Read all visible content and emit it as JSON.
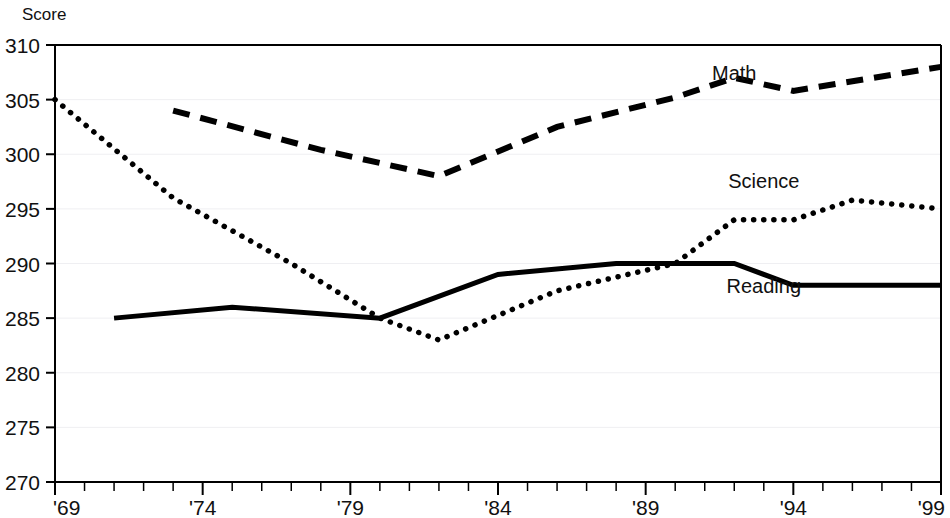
{
  "chart_data": {
    "type": "line",
    "title": "",
    "subtitle": "",
    "xlabel": "",
    "ylabel": "Score",
    "ylim": [
      270,
      310
    ],
    "xlim": [
      1969,
      1999
    ],
    "yticks": [
      270,
      275,
      280,
      285,
      290,
      295,
      300,
      305,
      310
    ],
    "ytick_labels": [
      "270",
      "275",
      "280",
      "285",
      "290",
      "295",
      "300",
      "305",
      "310"
    ],
    "xticks": [
      1969,
      1974,
      1979,
      1984,
      1989,
      1994,
      1999
    ],
    "xtick_labels": [
      "'69",
      "'74",
      "'79",
      "'84",
      "'89",
      "'94",
      "'99"
    ],
    "x_minor_tick_interval": 1,
    "grid": "horizontal-light",
    "legend_position": "inline-labels",
    "series": [
      {
        "name": "Math",
        "style": "dashed",
        "color": "#000000",
        "label_x": 1992,
        "label_y": 306.8,
        "points": [
          {
            "x": 1973,
            "y": 304
          },
          {
            "x": 1978,
            "y": 300.4
          },
          {
            "x": 1982,
            "y": 298
          },
          {
            "x": 1986,
            "y": 302.5
          },
          {
            "x": 1990,
            "y": 305.2
          },
          {
            "x": 1992,
            "y": 307
          },
          {
            "x": 1994,
            "y": 305.8
          },
          {
            "x": 1999,
            "y": 308
          }
        ]
      },
      {
        "name": "Science",
        "style": "dotted",
        "color": "#000000",
        "label_x": 1993,
        "label_y": 296.9,
        "points": [
          {
            "x": 1969,
            "y": 305
          },
          {
            "x": 1973,
            "y": 296
          },
          {
            "x": 1977,
            "y": 290
          },
          {
            "x": 1980,
            "y": 285
          },
          {
            "x": 1982,
            "y": 283
          },
          {
            "x": 1986,
            "y": 287.5
          },
          {
            "x": 1990,
            "y": 290
          },
          {
            "x": 1992,
            "y": 294
          },
          {
            "x": 1994,
            "y": 294
          },
          {
            "x": 1996,
            "y": 295.8
          },
          {
            "x": 1999,
            "y": 295
          }
        ]
      },
      {
        "name": "Reading",
        "style": "solid",
        "color": "#000000",
        "label_x": 1993,
        "label_y": 287.3,
        "points": [
          {
            "x": 1971,
            "y": 285
          },
          {
            "x": 1975,
            "y": 286
          },
          {
            "x": 1980,
            "y": 285
          },
          {
            "x": 1984,
            "y": 289
          },
          {
            "x": 1988,
            "y": 290
          },
          {
            "x": 1992,
            "y": 290
          },
          {
            "x": 1994,
            "y": 288
          },
          {
            "x": 1999,
            "y": 288
          }
        ]
      }
    ]
  },
  "axis": {
    "y_title": "Score"
  }
}
